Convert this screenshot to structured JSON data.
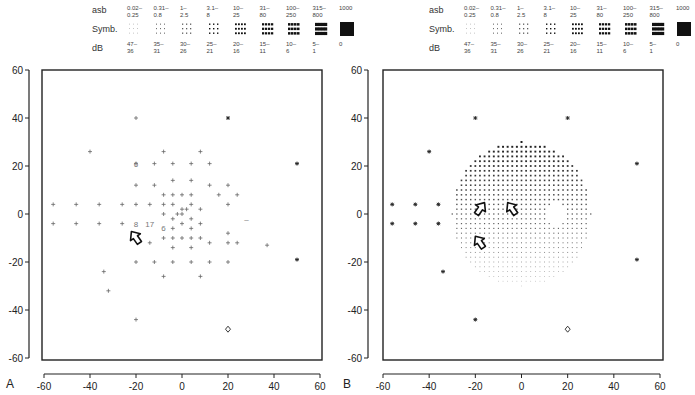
{
  "legend": {
    "row_labels": {
      "asb": "asb",
      "symb": "Symb.",
      "db": "dB"
    },
    "asb": [
      "0.02–\n0.25",
      "0.31–\n0.8",
      "1–\n2.5",
      "3.1–\n8",
      "10–\n25",
      "31–\n80",
      "100–\n250",
      "315–\n800",
      "1000"
    ],
    "db": [
      "47–\n36",
      "35–\n31",
      "30–\n26",
      "25–\n21",
      "20–\n16",
      "15–\n11",
      "10–\n6",
      "5–\n1",
      "0"
    ],
    "symbol_levels": [
      1,
      2,
      3,
      4,
      5,
      6,
      7,
      8,
      9
    ]
  },
  "chart_data": [
    {
      "type": "scatter",
      "panel_label": "A",
      "title": "",
      "xlabel": "",
      "ylabel": "",
      "xlim": [
        -60,
        60
      ],
      "ylim": [
        -60,
        60
      ],
      "xticks": [
        -60,
        -40,
        -20,
        0,
        20,
        40,
        60
      ],
      "yticks": [
        60,
        40,
        20,
        0,
        -20,
        -40,
        -60
      ],
      "grid": false,
      "points_plus": [
        [
          -20,
          40
        ],
        [
          -40,
          26
        ],
        [
          -20,
          21
        ],
        [
          -12,
          21
        ],
        [
          -4,
          21
        ],
        [
          4,
          21
        ],
        [
          12,
          21
        ],
        [
          -8,
          26
        ],
        [
          8,
          26
        ],
        [
          -20,
          12
        ],
        [
          -12,
          12
        ],
        [
          -4,
          14
        ],
        [
          4,
          14
        ],
        [
          12,
          12
        ],
        [
          20,
          12
        ],
        [
          -8,
          8
        ],
        [
          -4,
          8
        ],
        [
          0,
          8
        ],
        [
          4,
          8
        ],
        [
          16,
          8
        ],
        [
          24,
          8
        ],
        [
          -56,
          4
        ],
        [
          -46,
          4
        ],
        [
          -36,
          4
        ],
        [
          -26,
          4
        ],
        [
          -20,
          4
        ],
        [
          -14,
          4
        ],
        [
          -8,
          4
        ],
        [
          -4,
          4
        ],
        [
          0,
          2
        ],
        [
          4,
          4
        ],
        [
          8,
          2
        ],
        [
          20,
          4
        ],
        [
          -8,
          0
        ],
        [
          -4,
          -2
        ],
        [
          0,
          0
        ],
        [
          4,
          -2
        ],
        [
          8,
          -4
        ],
        [
          -2,
          0
        ],
        [
          2,
          2
        ],
        [
          -56,
          -4
        ],
        [
          -46,
          -4
        ],
        [
          -36,
          -4
        ],
        [
          -26,
          -4
        ],
        [
          -4,
          -6
        ],
        [
          0,
          -4
        ],
        [
          4,
          -6
        ],
        [
          20,
          -8
        ],
        [
          24,
          -12
        ],
        [
          -8,
          -10
        ],
        [
          -4,
          -10
        ],
        [
          0,
          -10
        ],
        [
          4,
          -10
        ],
        [
          8,
          -10
        ],
        [
          -14,
          -12
        ],
        [
          -4,
          -14
        ],
        [
          4,
          -14
        ],
        [
          12,
          -12
        ],
        [
          20,
          -12
        ],
        [
          -20,
          -20
        ],
        [
          -12,
          -20
        ],
        [
          -4,
          -20
        ],
        [
          4,
          -20
        ],
        [
          12,
          -20
        ],
        [
          20,
          -20
        ],
        [
          -8,
          -26
        ],
        [
          8,
          -26
        ],
        [
          -34,
          -24
        ],
        [
          -32,
          -32
        ],
        [
          -20,
          -44
        ],
        [
          37,
          -13
        ]
      ],
      "points_star": [
        [
          20,
          40
        ],
        [
          50,
          21
        ],
        [
          50,
          -19
        ]
      ],
      "points_diamond": [
        [
          20,
          -48
        ]
      ],
      "numeric_labels": [
        {
          "x": -20,
          "y": 21,
          "text": "6"
        },
        {
          "x": -20,
          "y": -4,
          "text": "8"
        },
        {
          "x": -14,
          "y": -4,
          "text": "17"
        },
        {
          "x": -8,
          "y": -6,
          "text": "6"
        },
        {
          "x": 28,
          "y": -2,
          "text": "–"
        }
      ],
      "arrows": [
        {
          "x": -20,
          "y": -10,
          "direction": "up-right"
        }
      ]
    },
    {
      "type": "heatmap",
      "panel_label": "B",
      "title": "",
      "xlabel": "",
      "ylabel": "",
      "xlim": [
        -60,
        60
      ],
      "ylim": [
        -60,
        60
      ],
      "xticks": [
        -60,
        -40,
        -20,
        0,
        20,
        40,
        60
      ],
      "yticks": [
        60,
        40,
        20,
        0,
        -20,
        -40,
        -60
      ],
      "grid": false,
      "dense_grid": {
        "center": [
          0,
          0
        ],
        "radius_deg": 30,
        "step_deg": 2,
        "description": "gray-scale symbol field, darker (lower sensitivity) superiorly, lighter inferiorly, blind spot blank near (15,-2)"
      },
      "blind_spot": {
        "x": 15,
        "y": 0,
        "rx": 4,
        "ry": 6
      },
      "points_star": [
        [
          -20,
          40
        ],
        [
          -40,
          26
        ],
        [
          20,
          40
        ],
        [
          50,
          21
        ],
        [
          50,
          -19
        ],
        [
          -56,
          4
        ],
        [
          -46,
          4
        ],
        [
          -36,
          4
        ],
        [
          -56,
          -4
        ],
        [
          -46,
          -4
        ],
        [
          -36,
          -4
        ],
        [
          -34,
          -24
        ],
        [
          -20,
          -44
        ]
      ],
      "points_diamond": [
        [
          20,
          -48
        ]
      ],
      "arrows": [
        {
          "x": -18,
          "y": 2,
          "direction": "up-left"
        },
        {
          "x": -4,
          "y": 2,
          "direction": "up-right"
        },
        {
          "x": -18,
          "y": -12,
          "direction": "up-right"
        }
      ]
    }
  ]
}
